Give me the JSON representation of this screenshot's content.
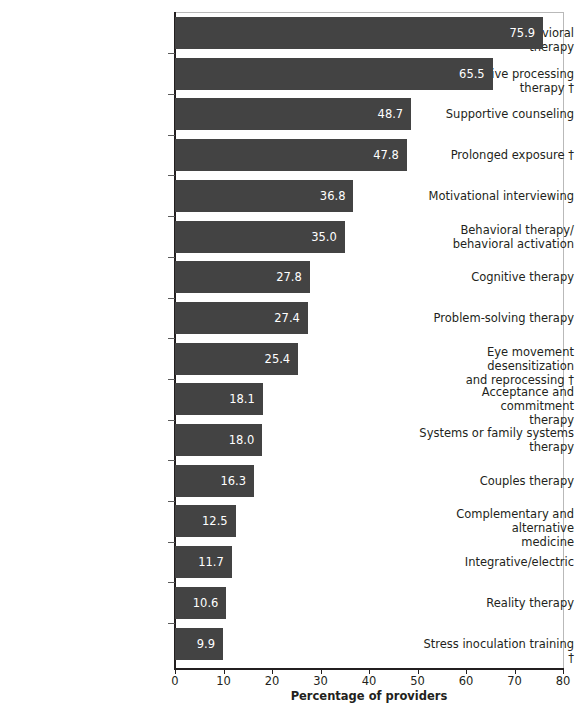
{
  "chart_data": {
    "type": "bar",
    "orientation": "horizontal",
    "title": "",
    "subtitle": "",
    "xlabel": "Percentage of providers",
    "ylabel": "",
    "xlim": [
      0,
      80
    ],
    "xticks": [
      0,
      10,
      20,
      30,
      40,
      50,
      60,
      70,
      80
    ],
    "xticklabels": [
      "0",
      "10",
      "20",
      "30",
      "40",
      "50",
      "60",
      "70",
      "80"
    ],
    "grid": false,
    "legend": null,
    "bar_color": "#434343",
    "value_label_color": "#ffffff",
    "categories": [
      "Cognitive behavioral therapy",
      "Cognitive processing therapy †",
      "Supportive counseling",
      "Prolonged exposure †",
      "Motivational interviewing",
      "Behavioral therapy/\nbehavioral activation",
      "Cognitive therapy",
      "Problem-solving therapy",
      "Eye movement desensitization\nand reprocessing †",
      "Acceptance and commitment\ntherapy",
      "Systems or family systems\ntherapy",
      "Couples therapy",
      "Complementary and alternative\nmedicine",
      "Integrative/electric",
      "Reality therapy",
      "Stress inoculation training †"
    ],
    "values": [
      75.9,
      65.5,
      48.7,
      47.8,
      36.8,
      35.0,
      27.8,
      27.4,
      25.4,
      18.1,
      18.0,
      16.3,
      12.5,
      11.7,
      10.6,
      9.9
    ],
    "value_labels": [
      "75.9",
      "65.5",
      "48.7",
      "47.8",
      "36.8",
      "35.0",
      "27.8",
      "27.4",
      "25.4",
      "18.1",
      "18.0",
      "16.3",
      "12.5",
      "11.7",
      "10.6",
      "9.9"
    ]
  }
}
